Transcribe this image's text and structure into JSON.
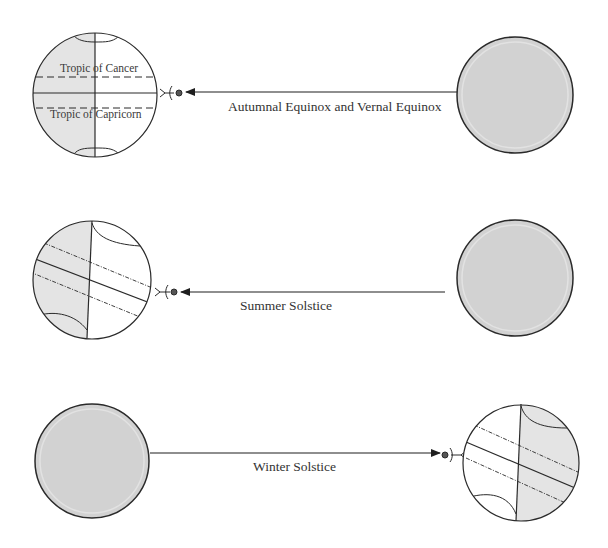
{
  "diagram": {
    "colors": {
      "background": "#ffffff",
      "stroke": "#2a2a2a",
      "sun_fill": "#d2d2d2",
      "sun_inner_ring": "#e2e2e2",
      "night_shading": "#e4e4e4",
      "text": "#333333"
    },
    "rows": [
      {
        "label": "Autumnal Equinox and Vernal Equinox",
        "earth_position": "left",
        "sun_position": "right",
        "arrow_direction": "left",
        "tropic_labels": {
          "cancer": "Tropic of Cancer",
          "capricorn": "Tropic of Capricorn"
        }
      },
      {
        "label": "Summer Solstice",
        "earth_position": "left",
        "sun_position": "right",
        "arrow_direction": "left"
      },
      {
        "label": "Winter Solstice",
        "earth_position": "right",
        "sun_position": "left",
        "arrow_direction": "right"
      }
    ]
  }
}
